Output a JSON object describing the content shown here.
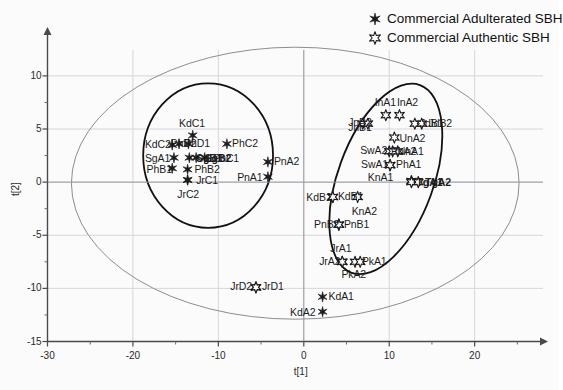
{
  "chart_data": {
    "type": "scatter",
    "title": "",
    "xlabel": "t[1]",
    "ylabel": "t[2]",
    "xlim": [
      -30,
      28
    ],
    "ylim": [
      -15,
      13
    ],
    "xticks": [
      -30,
      -20,
      -10,
      0,
      10,
      20
    ],
    "yticks": [
      -15,
      -10,
      -5,
      0,
      5,
      10
    ],
    "grid": true,
    "legend_position": "top-right",
    "series": [
      {
        "name": "Commercial Adulterated SBH",
        "marker": "filled-star",
        "points": [
          {
            "label": "KdC1",
            "x": -13.0,
            "y": 4.4,
            "lx": -14.6,
            "ly": 5.6,
            "bold": false
          },
          {
            "label": "KdC2",
            "x": -15.4,
            "y": 3.5,
            "lx": -18.6,
            "ly": 3.6,
            "bold": false
          },
          {
            "label": "PhD2",
            "x": -14.6,
            "y": 3.6,
            "lx": -15.6,
            "ly": 3.7,
            "bold": false
          },
          {
            "label": "PhD1",
            "x": -13.5,
            "y": 3.6,
            "lx": -14.0,
            "ly": 3.7,
            "bold": false
          },
          {
            "label": "PhC2",
            "x": -9.0,
            "y": 3.6,
            "lx": -8.4,
            "ly": 3.7,
            "bold": false
          },
          {
            "label": "SgA1",
            "x": -15.2,
            "y": 2.3,
            "lx": -18.6,
            "ly": 2.3,
            "bold": false
          },
          {
            "label": "SgB1",
            "x": -13.4,
            "y": 2.3,
            "lx": -12.6,
            "ly": 2.3,
            "bold": true
          },
          {
            "label": "SgB2",
            "x": -12.6,
            "y": 2.3,
            "lx": -11.6,
            "ly": 2.3,
            "bold": true
          },
          {
            "label": "PhC1",
            "x": -11.6,
            "y": 2.3,
            "lx": -10.6,
            "ly": 2.3,
            "bold": false
          },
          {
            "label": "PnA2",
            "x": -4.2,
            "y": 1.9,
            "lx": -3.5,
            "ly": 2.0,
            "bold": false
          },
          {
            "label": "PhB1",
            "x": -15.4,
            "y": 1.3,
            "lx": -18.4,
            "ly": 1.2,
            "bold": false
          },
          {
            "label": "PhB2",
            "x": -13.6,
            "y": 1.2,
            "lx": -12.8,
            "ly": 1.2,
            "bold": false
          },
          {
            "label": "PnA1",
            "x": -4.2,
            "y": 0.5,
            "lx": -7.8,
            "ly": 0.5,
            "bold": false
          },
          {
            "label": "JrC1",
            "x": -13.6,
            "y": 0.2,
            "lx": -12.6,
            "ly": 0.2,
            "bold": false
          },
          {
            "label": "JrC2",
            "x": -13.6,
            "y": 0.2,
            "lx": -14.8,
            "ly": -1.1,
            "bold": false
          },
          {
            "label": "KdA1",
            "x": 2.2,
            "y": -10.8,
            "lx": 2.9,
            "ly": -10.7,
            "bold": false
          },
          {
            "label": "KdA2",
            "x": 2.2,
            "y": -12.2,
            "lx": -1.6,
            "ly": -12.2,
            "bold": false
          }
        ]
      },
      {
        "name": "Commercial Authentic SBH",
        "marker": "open-star",
        "points": [
          {
            "label": "InA1",
            "x": 9.6,
            "y": 6.3,
            "lx": 8.3,
            "ly": 7.5,
            "bold": false
          },
          {
            "label": "InA2",
            "x": 11.2,
            "y": 6.3,
            "lx": 10.9,
            "ly": 7.5,
            "bold": false
          },
          {
            "label": "JnB2",
            "x": 6.9,
            "y": 5.5,
            "lx": 5.2,
            "ly": 5.7,
            "bold": false
          },
          {
            "label": "JnB1",
            "x": 7.5,
            "y": 5.5,
            "lx": 5.2,
            "ly": 5.2,
            "bold": false
          },
          {
            "label": "JdB1",
            "x": 13.0,
            "y": 5.5,
            "lx": 13.6,
            "ly": 5.6,
            "bold": false
          },
          {
            "label": "JdB2",
            "x": 13.8,
            "y": 5.5,
            "lx": 14.6,
            "ly": 5.6,
            "bold": false
          },
          {
            "label": "UnA2",
            "x": 10.6,
            "y": 4.2,
            "lx": 11.2,
            "ly": 4.2,
            "bold": false
          },
          {
            "label": "SwA2",
            "x": 10.0,
            "y": 2.9,
            "lx": 6.6,
            "ly": 3.0,
            "bold": false
          },
          {
            "label": "UnA1",
            "x": 11.0,
            "y": 2.9,
            "lx": 11.0,
            "ly": 2.9,
            "bold": false
          },
          {
            "label": "PhA2",
            "x": 10.4,
            "y": 2.9,
            "lx": 10.2,
            "ly": 2.9,
            "bold": false
          },
          {
            "label": "SwA1",
            "x": 10.1,
            "y": 1.6,
            "lx": 6.7,
            "ly": 1.7,
            "bold": false
          },
          {
            "label": "PhA1",
            "x": 10.1,
            "y": 1.6,
            "lx": 10.8,
            "ly": 1.7,
            "bold": false
          },
          {
            "label": "KnA1",
            "x": 12.6,
            "y": 0.1,
            "lx": 7.5,
            "ly": 0.5,
            "bold": false
          },
          {
            "label": "TgA1",
            "x": 12.6,
            "y": 0.0,
            "lx": 13.2,
            "ly": 0.0,
            "bold": true
          },
          {
            "label": "TgA2",
            "x": 13.4,
            "y": 0.0,
            "lx": 14.2,
            "ly": 0.0,
            "bold": true
          },
          {
            "label": "KdB1",
            "x": 3.4,
            "y": -1.4,
            "lx": 4.0,
            "ly": -1.3,
            "bold": false
          },
          {
            "label": "KdB2",
            "x": 3.4,
            "y": -1.4,
            "lx": 0.3,
            "ly": -1.4,
            "bold": false
          },
          {
            "label": "KnA2",
            "x": 6.3,
            "y": -1.4,
            "lx": 5.6,
            "ly": -2.7,
            "bold": false
          },
          {
            "label": "PnB2",
            "x": 4.1,
            "y": -4.0,
            "lx": 1.2,
            "ly": -3.9,
            "bold": false
          },
          {
            "label": "PnB1",
            "x": 4.1,
            "y": -4.0,
            "lx": 4.7,
            "ly": -3.9,
            "bold": false
          },
          {
            "label": "JrA2",
            "x": 4.5,
            "y": -7.5,
            "lx": 1.8,
            "ly": -7.4,
            "bold": false
          },
          {
            "label": "JrA1",
            "x": 4.5,
            "y": -7.5,
            "lx": 3.1,
            "ly": -6.2,
            "bold": false
          },
          {
            "label": "PkA1",
            "x": 6.0,
            "y": -7.5,
            "lx": 6.8,
            "ly": -7.4,
            "bold": false
          },
          {
            "label": "PkA2",
            "x": 6.6,
            "y": -7.5,
            "lx": 4.4,
            "ly": -8.6,
            "bold": false
          },
          {
            "label": "JrD2",
            "x": -5.6,
            "y": -9.9,
            "lx": -8.6,
            "ly": -9.8,
            "bold": false
          },
          {
            "label": "JrD1",
            "x": -5.6,
            "y": -9.9,
            "lx": -4.9,
            "ly": -9.8,
            "bold": false
          }
        ]
      }
    ],
    "ellipses": [
      {
        "name": "hotelling-t2-ellipse",
        "cx": -1.0,
        "cy": -0.1,
        "rx": 26.2,
        "ry": 12.8,
        "rotate": 0,
        "stroke": "#8d8d8d",
        "width": 1.0
      },
      {
        "name": "adulterated-cluster-ellipse",
        "cx": -11.2,
        "cy": 2.5,
        "rx": 7.6,
        "ry": 6.8,
        "rotate": 0,
        "stroke": "#111111",
        "width": 1.8
      },
      {
        "name": "authentic-cluster-ellipse",
        "cx": 9.6,
        "cy": 0.3,
        "rx": 5.6,
        "ry": 9.4,
        "rotate": 20,
        "stroke": "#111111",
        "width": 1.8
      }
    ]
  },
  "legend": {
    "items": [
      {
        "label": "Commercial Adulterated SBH",
        "marker": "filled-star"
      },
      {
        "label": "Commercial Authentic SBH",
        "marker": "open-star"
      }
    ]
  },
  "axes": {
    "x_title": "t[1]",
    "y_title": "t[2]"
  }
}
